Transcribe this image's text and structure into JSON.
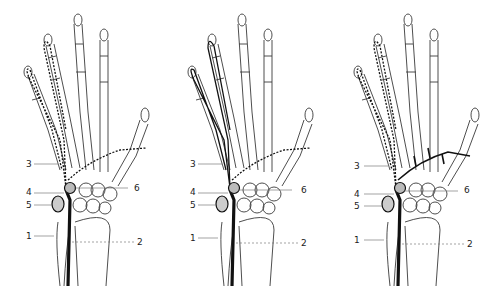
{
  "figure": {
    "colors": {
      "bone_outline": "#3a3a3a",
      "nerve": "#111111",
      "background": "#ffffff"
    },
    "panels": [
      {
        "id": "panel-1",
        "variant": "superficial and deep branches dashed",
        "labels": {
          "l1": "1",
          "l2": "2",
          "l3": "3",
          "l4": "4",
          "l5": "5",
          "l6": "6"
        }
      },
      {
        "id": "panel-2",
        "variant": "superficial branch solid, deep branch dashed",
        "labels": {
          "l1": "1",
          "l2": "2",
          "l3": "3",
          "l4": "4",
          "l5": "5",
          "l6": "6"
        }
      },
      {
        "id": "panel-3",
        "variant": "superficial branch dashed, deep branch solid",
        "labels": {
          "l1": "1",
          "l2": "2",
          "l3": "3",
          "l4": "4",
          "l5": "5",
          "l6": "6"
        }
      }
    ]
  }
}
